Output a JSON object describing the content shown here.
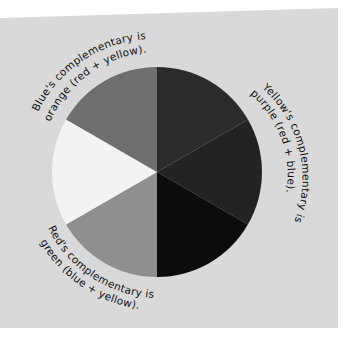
{
  "diagram": {
    "background_color": "#d9d9d9",
    "wheel": {
      "center": [
        157,
        172
      ],
      "radius": 105,
      "segments": [
        {
          "name": "red",
          "color": "#2b2b2b"
        },
        {
          "name": "red-purple",
          "color": "#262626"
        },
        {
          "name": "purple-blue",
          "color": "#0c0c0c"
        },
        {
          "name": "green",
          "color": "#8f8f8f"
        },
        {
          "name": "yellow",
          "color": "#f2f2f2"
        },
        {
          "name": "orange",
          "color": "#6f6f6f"
        }
      ]
    },
    "captions": {
      "blue": {
        "line1": "Blue's complementary is",
        "line2": "orange (red + yellow)."
      },
      "yellow": {
        "line1": "Yellow's complementary is",
        "line2": "purple (red + blue)."
      },
      "red": {
        "line1": "Red's complementary is",
        "line2": "green (blue + yellow)."
      }
    }
  }
}
